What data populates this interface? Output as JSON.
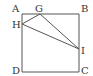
{
  "diagram": {
    "type": "geometry",
    "colors": {
      "stroke": "#555555",
      "label": "#333333",
      "background": "#ffffff"
    },
    "points": {
      "A": {
        "label": "A",
        "x": 22,
        "y": 14,
        "label_x": 12,
        "label_y": 12
      },
      "B": {
        "label": "B",
        "x": 79,
        "y": 14,
        "label_x": 81,
        "label_y": 12
      },
      "C": {
        "label": "C",
        "x": 79,
        "y": 72,
        "label_x": 81,
        "label_y": 74
      },
      "D": {
        "label": "D",
        "x": 22,
        "y": 72,
        "label_x": 12,
        "label_y": 74
      },
      "G": {
        "label": "G",
        "x": 40,
        "y": 14,
        "label_x": 35,
        "label_y": 12
      },
      "H": {
        "label": "H",
        "x": 22,
        "y": 24,
        "label_x": 12,
        "label_y": 28
      },
      "I": {
        "label": "I",
        "x": 79,
        "y": 49,
        "label_x": 81,
        "label_y": 54
      }
    },
    "segments": [
      "AB",
      "BC",
      "CD",
      "DA",
      "GH",
      "GI",
      "HI"
    ]
  }
}
